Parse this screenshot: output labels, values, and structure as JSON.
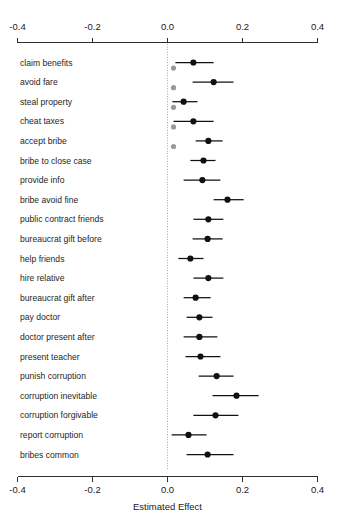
{
  "chart_data": {
    "type": "scatter",
    "plot_style": "forest-plot / coefficient plot with 95% confidence intervals",
    "title": "",
    "xlabel": "Estimated Effect",
    "ylabel": "",
    "xlim": [
      -0.4,
      0.4
    ],
    "xticks": [
      -0.4,
      -0.2,
      0.0,
      0.2,
      0.4
    ],
    "xtick_labels": [
      "-0.4",
      "-0.2",
      "0.0",
      "0.2",
      "0.4"
    ],
    "grid": false,
    "legend": null,
    "reference_line": {
      "value": 0.0,
      "style": "dotted",
      "color": "#8c8c8c"
    },
    "categories": [
      "claim benefits",
      "avoid fare",
      "steal property",
      "cheat taxes",
      "accept bribe",
      "bribe to close case",
      "provide info",
      "bribe avoid fine",
      "public contract friends",
      "bureaucrat gift before",
      "help friends",
      "hire relative",
      "bureaucrat gift after",
      "pay doctor",
      "doctor present after",
      "present teacher",
      "punish corruption",
      "corruption inevitable",
      "corruption forgivable",
      "report corruption",
      "bribes common"
    ],
    "series": [
      {
        "name": "primary estimate",
        "color": "#111111",
        "estimates": [
          0.069,
          0.123,
          0.043,
          0.069,
          0.109,
          0.096,
          0.093,
          0.16,
          0.109,
          0.107,
          0.061,
          0.109,
          0.075,
          0.085,
          0.085,
          0.088,
          0.131,
          0.184,
          0.128,
          0.056,
          0.107
        ],
        "ci_low": [
          0.021,
          0.067,
          0.013,
          0.016,
          0.075,
          0.061,
          0.043,
          0.123,
          0.069,
          0.067,
          0.029,
          0.069,
          0.043,
          0.051,
          0.043,
          0.048,
          0.083,
          0.12,
          0.069,
          0.011,
          0.051
        ],
        "ci_high": [
          0.123,
          0.176,
          0.08,
          0.123,
          0.147,
          0.128,
          0.141,
          0.203,
          0.149,
          0.147,
          0.096,
          0.149,
          0.115,
          0.12,
          0.133,
          0.141,
          0.176,
          0.243,
          0.189,
          0.104,
          0.176
        ]
      },
      {
        "name": "secondary estimate",
        "color": "#9a9a9a",
        "estimates": [
          0.016,
          0.016,
          0.016,
          0.016,
          0.016,
          null,
          null,
          null,
          null,
          null,
          null,
          null,
          null,
          null,
          null,
          null,
          null,
          null,
          null,
          null,
          null
        ]
      }
    ]
  },
  "axis": {
    "x_title": "Estimated Effect"
  },
  "caption": {
    "partial_line": ""
  }
}
